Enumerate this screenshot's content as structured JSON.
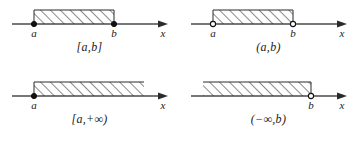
{
  "figure": {
    "axis_label": "x",
    "endpoint_label_left": "a",
    "endpoint_label_right": "b",
    "colors": {
      "ink": "#1a1a1a",
      "axis": "#4a4a4a",
      "hatch": "#2b2b2b",
      "background": "#ffffff"
    }
  },
  "panels": [
    {
      "id": "closed-interval",
      "caption": "[a,b]",
      "left_endpoint": {
        "label": "a",
        "style": "filled"
      },
      "right_endpoint": {
        "label": "b",
        "style": "filled"
      },
      "band": {
        "left_bounded": true,
        "right_bounded": true
      },
      "axis_label": "x"
    },
    {
      "id": "open-interval",
      "caption": "(a,b)",
      "left_endpoint": {
        "label": "a",
        "style": "open"
      },
      "right_endpoint": {
        "label": "b",
        "style": "open"
      },
      "band": {
        "left_bounded": true,
        "right_bounded": true
      },
      "axis_label": "x"
    },
    {
      "id": "closed-ray-right",
      "caption": "[a,+∞)",
      "left_endpoint": {
        "label": "a",
        "style": "filled"
      },
      "right_endpoint": {
        "label": "",
        "style": "none"
      },
      "band": {
        "left_bounded": true,
        "right_bounded": false
      },
      "axis_label": "x"
    },
    {
      "id": "open-ray-left",
      "caption": "(−∞,b)",
      "left_endpoint": {
        "label": "",
        "style": "none"
      },
      "right_endpoint": {
        "label": "b",
        "style": "open"
      },
      "band": {
        "left_bounded": false,
        "right_bounded": true
      },
      "axis_label": "x"
    }
  ]
}
